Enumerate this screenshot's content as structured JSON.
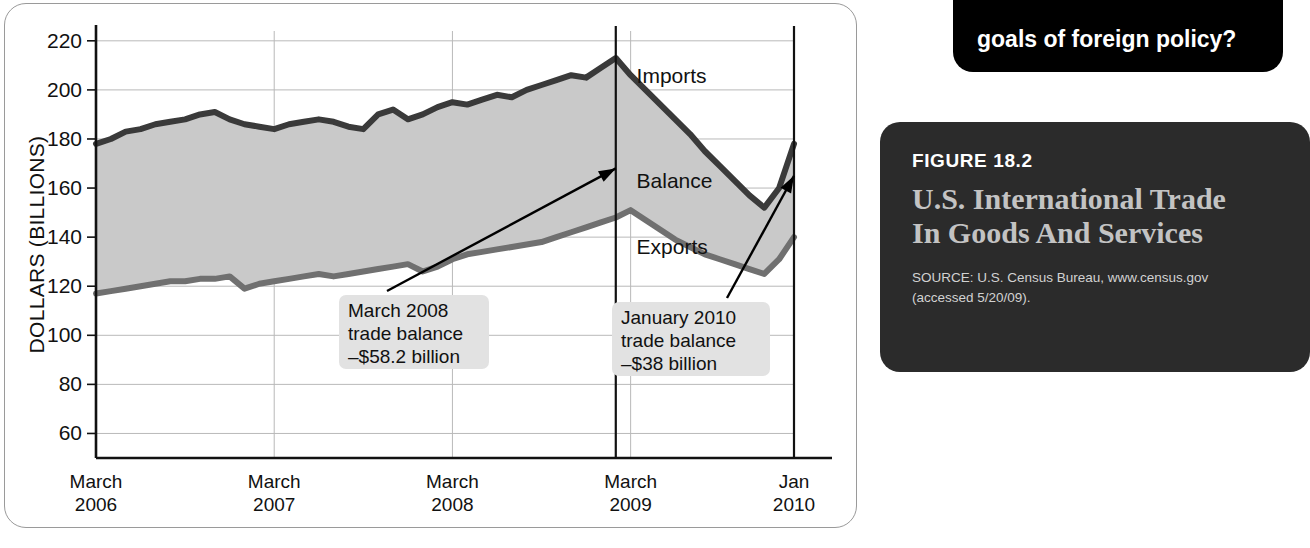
{
  "figure": {
    "number": "FIGURE 18.2",
    "title": "U.S. International Trade In Goods And Services",
    "source": "SOURCE: U.S. Census Bureau, www.census.gov (accessed 5/20/09)."
  },
  "question_bubble": {
    "text": "goals of foreign policy?"
  },
  "chart_data": {
    "type": "area",
    "title": "U.S. International Trade In Goods And Services",
    "xlabel": "",
    "ylabel": "DOLLARS (BILLIONS)",
    "ylim": [
      50,
      224
    ],
    "yticks": [
      60,
      80,
      100,
      120,
      140,
      160,
      180,
      200,
      220
    ],
    "grid": true,
    "legend": "inline",
    "xtick_labels": [
      {
        "line1": "March",
        "line2": "2006"
      },
      {
        "line1": "March",
        "line2": "2007"
      },
      {
        "line1": "March",
        "line2": "2008"
      },
      {
        "line1": "March",
        "line2": "2009"
      },
      {
        "line1": "Jan",
        "line2": "2010"
      }
    ],
    "xtick_positions": [
      0,
      12,
      24,
      36,
      47
    ],
    "x": [
      0,
      1,
      2,
      3,
      4,
      5,
      6,
      7,
      8,
      9,
      10,
      11,
      12,
      13,
      14,
      15,
      16,
      17,
      18,
      19,
      20,
      21,
      22,
      23,
      24,
      25,
      26,
      27,
      28,
      29,
      30,
      31,
      32,
      33,
      34,
      35,
      36,
      37,
      38,
      39,
      40,
      41,
      42,
      43,
      44,
      45,
      46,
      47
    ],
    "series": [
      {
        "name": "Imports",
        "color": "#3a3a3a",
        "values": [
          178,
          180,
          183,
          184,
          186,
          187,
          188,
          190,
          191,
          188,
          186,
          185,
          184,
          186,
          187,
          188,
          187,
          185,
          184,
          190,
          192,
          188,
          190,
          193,
          195,
          194,
          196,
          198,
          197,
          200,
          202,
          204,
          206,
          205,
          209,
          213,
          206,
          200,
          194,
          188,
          182,
          175,
          169,
          163,
          157,
          152,
          160,
          178
        ]
      },
      {
        "name": "Exports",
        "color": "#707070",
        "values": [
          117,
          118,
          119,
          120,
          121,
          122,
          122,
          123,
          123,
          124,
          119,
          121,
          122,
          123,
          124,
          125,
          124,
          125,
          126,
          127,
          128,
          129,
          126,
          128,
          131,
          133,
          134,
          135,
          136,
          137,
          138,
          140,
          142,
          144,
          146,
          148,
          151,
          147,
          143,
          139,
          136,
          133,
          131,
          129,
          127,
          125,
          131,
          140
        ]
      }
    ],
    "band_label": "Balance",
    "annotations": [
      {
        "name": "march-2008-callout",
        "lines": [
          "March 2008",
          "trade balance",
          "–$58.2 billion"
        ],
        "event_x": 35
      },
      {
        "name": "january-2010-callout",
        "lines": [
          "January 2010",
          "trade balance",
          "–$38 billion"
        ],
        "event_x": 47
      }
    ],
    "event_lines": [
      35,
      47
    ]
  }
}
